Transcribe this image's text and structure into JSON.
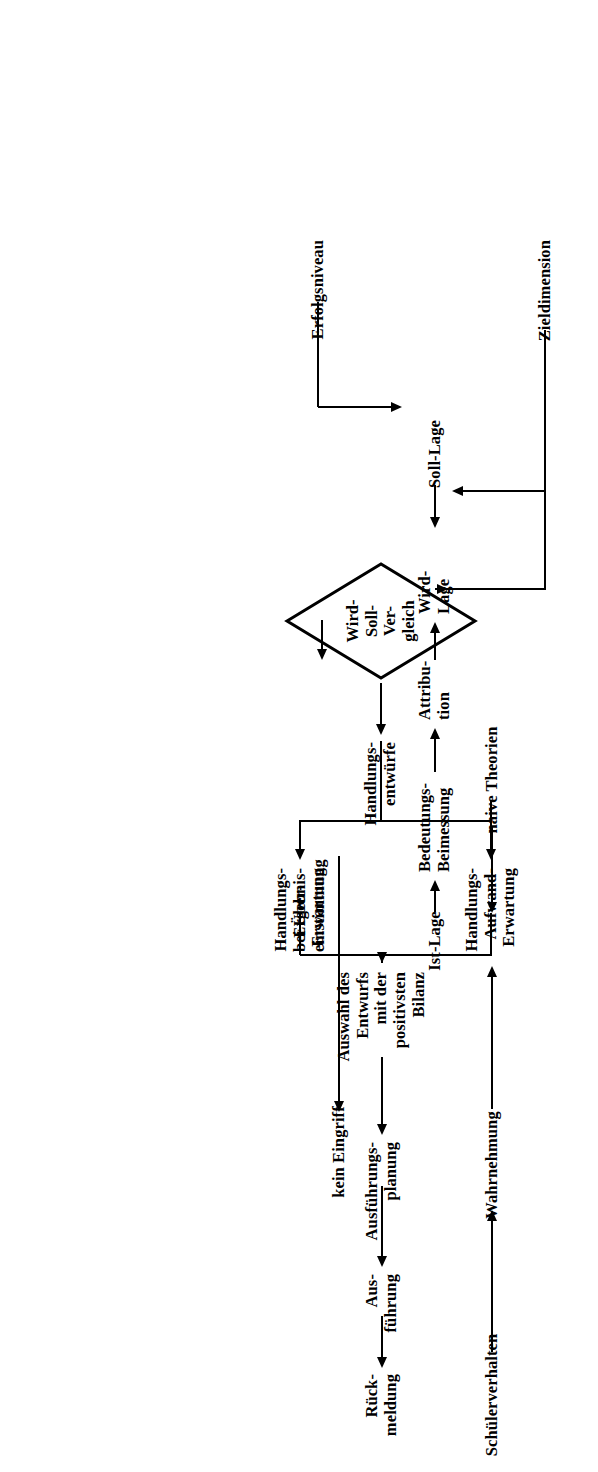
{
  "diagram": {
    "language": "de",
    "orientation": "rotated-90-ccw",
    "ink_color": "#000000",
    "background_color": "#ffffff"
  },
  "nodes": {
    "schuelerverhalten": "Schülerverhalten",
    "wahrnehmung": "Wahrnehmung",
    "naive_theorien": "naive Theorien",
    "ist_lage": "Ist-Lage",
    "bedeutungs_beimessung": "Bedeutungs-\nBeimessung",
    "attribution": "Attribu-\ntion",
    "zieldimension": "Zieldimension",
    "erfolgsniveau": "Erfolgsniveau",
    "soll_lage": "Soll-Lage",
    "wird_lage": "Wird-\nLage",
    "vergleich": "Wird-\nSoll-\nVer-\ngleich",
    "bei_uebereinstimmung": "bei Über-\neinstimmung",
    "kein_eingriff": "kein Eingriff",
    "handlungsentwuerfe": "Handlungs-\nentwürfe",
    "handlungs_ergebnis_erwartung": "Handlungs-\nErgebnis-\nErwartung",
    "handlungs_aufwand_erwartung": "Handlungs-\nAufwand-\nErwartung",
    "auswahl": "Auswahl des\nEntwurfs\nmit der\npositivsten\nBilanz",
    "ausfuehrungsplanung": "Ausführungs-\nplanung",
    "ausfuehrung": "Aus-\nführung",
    "rueckmeldung": "Rück-\nmeldung"
  },
  "edges": [
    {
      "id": "e1",
      "from": "schuelerverhalten",
      "to": "wahrnehmung",
      "type": "arrow"
    },
    {
      "id": "e2",
      "from": "wahrnehmung",
      "to": "ist-lage",
      "type": "arrow"
    },
    {
      "id": "e3",
      "from": "naive-theorien",
      "to": "ist-lage",
      "type": "arrow"
    },
    {
      "id": "e4",
      "from": "ist-lage",
      "to": "bedeutungs-beimessung",
      "type": "arrow"
    },
    {
      "id": "e5",
      "from": "bedeutungs-beimessung",
      "to": "attribution",
      "type": "arrow"
    },
    {
      "id": "e6",
      "from": "attribution",
      "to": "wird-lage",
      "type": "arrow"
    },
    {
      "id": "e7",
      "from": "zieldimension",
      "to": "wird-lage",
      "type": "elbow-arrow"
    },
    {
      "id": "e8",
      "from": "zieldimension",
      "to": "soll-lage",
      "type": "elbow-arrow"
    },
    {
      "id": "e9",
      "from": "erfolgsniveau",
      "to": "soll-lage",
      "type": "elbow-arrow"
    },
    {
      "id": "e10",
      "from": "soll-lage",
      "to": "wird-soll-vergleich",
      "type": "arrow"
    },
    {
      "id": "e11",
      "from": "wird-lage",
      "to": "wird-soll-vergleich",
      "type": "arrow"
    },
    {
      "id": "e12",
      "from": "wird-soll-vergleich",
      "to": "kein-eingriff",
      "type": "labelled-arrow",
      "label": "bei Über-\neinstimmung"
    },
    {
      "id": "e13",
      "from": "wird-soll-vergleich",
      "to": "handlungsentwuerfe",
      "type": "arrow"
    },
    {
      "id": "e14",
      "from": "handlungsentwuerfe",
      "to": "handlungs-ergebnis-erwartung",
      "type": "elbow-arrow"
    },
    {
      "id": "e15",
      "from": "handlungsentwuerfe",
      "to": "handlungs-aufwand-erwartung",
      "type": "elbow-arrow"
    },
    {
      "id": "e16",
      "from": "handlungs-ergebnis-erwartung",
      "to": "auswahl",
      "type": "elbow-arrow"
    },
    {
      "id": "e17",
      "from": "handlungs-aufwand-erwartung",
      "to": "auswahl",
      "type": "elbow-arrow"
    },
    {
      "id": "e18",
      "from": "auswahl",
      "to": "ausfuehrungsplanung",
      "type": "arrow"
    },
    {
      "id": "e19",
      "from": "ausfuehrungsplanung",
      "to": "ausfuehrung",
      "type": "arrow"
    },
    {
      "id": "e20",
      "from": "ausfuehrung",
      "to": "rueckmeldung",
      "type": "arrow"
    }
  ]
}
